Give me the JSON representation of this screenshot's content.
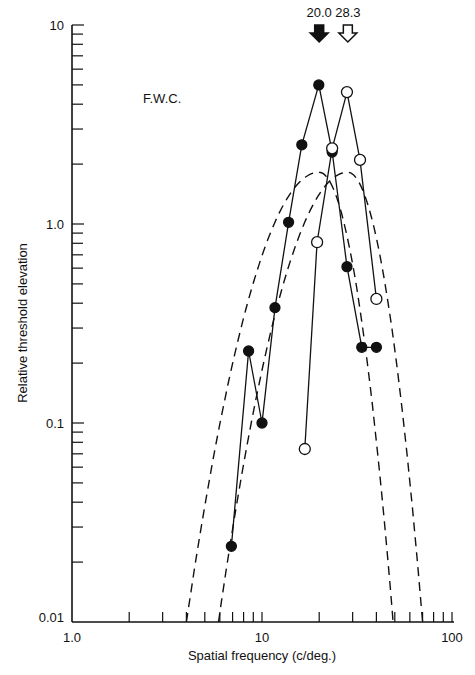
{
  "chart_data": {
    "type": "line",
    "title": "",
    "annotation_subject": "F.W.C.",
    "xlabel": "Spatial frequency (c/deg.)",
    "ylabel": "Relative threshold elevation",
    "xscale": "log",
    "yscale": "log",
    "xlim": [
      1.0,
      100
    ],
    "ylim": [
      0.01,
      10
    ],
    "x_tick_labels": [
      "1.0",
      "10",
      "100"
    ],
    "y_tick_labels": [
      "0.01",
      "0.1",
      "1.0",
      "10"
    ],
    "grid": false,
    "legend": null,
    "arrows": [
      {
        "label": "20.0",
        "x": 20.0,
        "style": "filled"
      },
      {
        "label": "28.3",
        "x": 28.3,
        "style": "open"
      }
    ],
    "series": [
      {
        "name": "adapt 20.0 c/deg (filled)",
        "marker": "filled-circle",
        "line": "solid",
        "x": [
          6.9,
          8.5,
          10.0,
          11.7,
          13.8,
          16.2,
          19.9,
          23.4,
          28.0,
          33.5,
          40.0
        ],
        "y": [
          0.024,
          0.23,
          0.1,
          0.38,
          1.02,
          2.5,
          5.0,
          2.3,
          0.61,
          0.24,
          0.24
        ]
      },
      {
        "name": "adapt 28.3 c/deg (open)",
        "marker": "open-circle",
        "line": "solid",
        "x": [
          16.8,
          19.5,
          23.4,
          28.0,
          32.8,
          40.0
        ],
        "y": [
          0.074,
          0.81,
          2.4,
          4.6,
          2.1,
          0.42
        ]
      },
      {
        "name": "fitted curve 20.0",
        "marker": "none",
        "line": "dashed",
        "peak_x": 20.0,
        "peak_y": 1.82,
        "x_at_ymin": [
          4.0,
          49
        ]
      },
      {
        "name": "fitted curve 28.3",
        "marker": "none",
        "line": "dashed",
        "peak_x": 28.3,
        "peak_y": 1.82,
        "x_at_ymin": [
          5.9,
          70
        ]
      }
    ]
  }
}
